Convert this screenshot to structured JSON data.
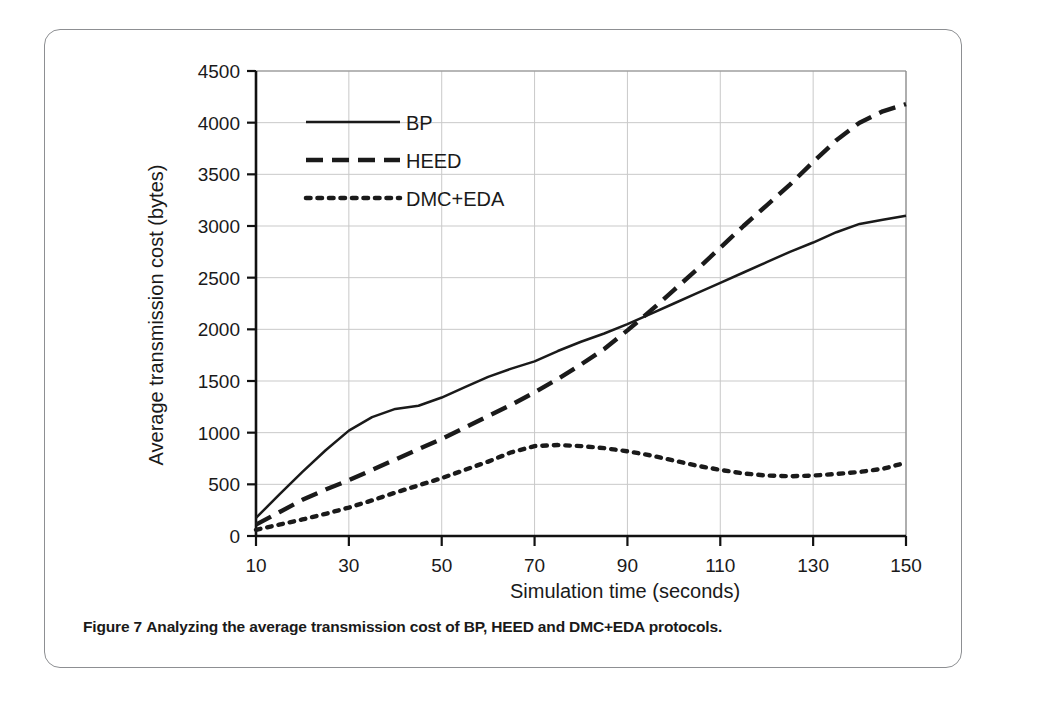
{
  "figure": {
    "caption_label": "Figure 7",
    "caption_text": "Analyzing the average transmission cost of BP, HEED and DMC+EDA protocols."
  },
  "chart_data": {
    "type": "line",
    "title": "",
    "xlabel": "Simulation time (seconds)",
    "ylabel": "Average transmission cost (bytes)",
    "xlim": [
      10,
      150
    ],
    "ylim": [
      0,
      4500
    ],
    "xticks": [
      10,
      30,
      50,
      70,
      90,
      110,
      130,
      150
    ],
    "xtick_labels": [
      "10",
      "30",
      "50",
      "70",
      "90",
      "110",
      "130",
      "150"
    ],
    "yticks": [
      0,
      500,
      1000,
      1500,
      2000,
      2500,
      3000,
      3500,
      4000,
      4500
    ],
    "ytick_labels": [
      "0",
      "500",
      "1000",
      "1500",
      "2000",
      "2500",
      "3000",
      "3500",
      "4000",
      "4500"
    ],
    "grid": true,
    "legend_position": "top-left",
    "x": [
      10,
      15,
      20,
      25,
      30,
      35,
      40,
      45,
      50,
      55,
      60,
      65,
      70,
      75,
      80,
      85,
      90,
      95,
      100,
      105,
      110,
      115,
      120,
      125,
      130,
      135,
      140,
      145,
      150
    ],
    "series": [
      {
        "name": "BP",
        "style": "solid",
        "color": "#1a1a1a",
        "values": [
          175,
          400,
          620,
          830,
          1020,
          1150,
          1230,
          1260,
          1340,
          1440,
          1540,
          1620,
          1690,
          1790,
          1880,
          1960,
          2050,
          2150,
          2250,
          2350,
          2450,
          2550,
          2650,
          2750,
          2840,
          2940,
          3020,
          3060,
          3100
        ]
      },
      {
        "name": "HEED",
        "style": "dashed",
        "color": "#1a1a1a",
        "values": [
          110,
          230,
          350,
          450,
          540,
          640,
          740,
          840,
          940,
          1050,
          1160,
          1270,
          1390,
          1520,
          1660,
          1810,
          1990,
          2180,
          2380,
          2580,
          2790,
          3000,
          3200,
          3400,
          3620,
          3830,
          4000,
          4110,
          4180
        ]
      },
      {
        "name": "DMC+EDA",
        "style": "dotted",
        "color": "#1a1a1a",
        "values": [
          60,
          110,
          160,
          215,
          275,
          345,
          420,
          490,
          560,
          640,
          720,
          810,
          870,
          880,
          870,
          850,
          820,
          780,
          730,
          680,
          640,
          605,
          585,
          578,
          585,
          600,
          620,
          650,
          710
        ]
      }
    ]
  }
}
